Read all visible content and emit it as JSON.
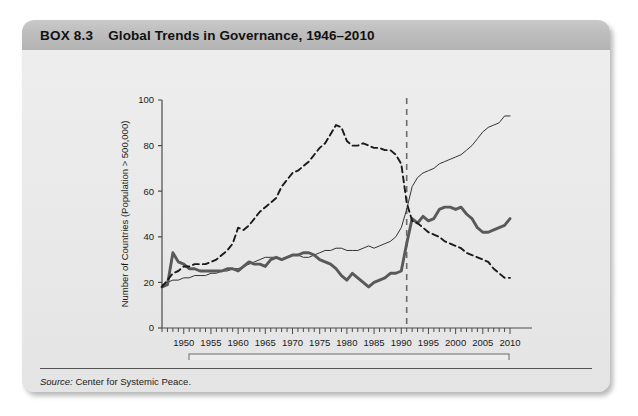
{
  "box": {
    "number": "BOX 8.3",
    "title": "Global Trends in Governance, 1946–2010"
  },
  "source": {
    "label": "Source:",
    "text": "Center for Systemic Peace."
  },
  "chart_data": {
    "type": "line",
    "title": "Global Trends in Governance, 1946–2010",
    "xlabel": "",
    "ylabel": "Number of Countries (Population > 500,000)",
    "xlim": [
      1946,
      2010
    ],
    "ylim": [
      0,
      100
    ],
    "ytick_labels": [
      "0",
      "20",
      "40",
      "60",
      "80",
      "100"
    ],
    "yticks": [
      0,
      20,
      40,
      60,
      80,
      100
    ],
    "xtick_labels": [
      "1950",
      "1955",
      "1960",
      "1965",
      "1970",
      "1975",
      "1980",
      "1985",
      "1990",
      "1995",
      "2000",
      "2005",
      "2010"
    ],
    "xticks": [
      1950,
      1955,
      1960,
      1965,
      1970,
      1975,
      1980,
      1985,
      1990,
      1995,
      2000,
      2005,
      2010
    ],
    "minor_tick_interval": 1,
    "grid": false,
    "legend_position": "bottom",
    "annotations": [
      {
        "type": "vline",
        "x": 1991,
        "style": "dashed",
        "color": "#6b6b6b"
      }
    ],
    "x": [
      1946,
      1947,
      1948,
      1949,
      1950,
      1951,
      1952,
      1953,
      1954,
      1955,
      1956,
      1957,
      1958,
      1959,
      1960,
      1961,
      1962,
      1963,
      1964,
      1965,
      1966,
      1967,
      1968,
      1969,
      1970,
      1971,
      1972,
      1973,
      1974,
      1975,
      1976,
      1977,
      1978,
      1979,
      1980,
      1981,
      1982,
      1983,
      1984,
      1985,
      1986,
      1987,
      1988,
      1989,
      1990,
      1991,
      1992,
      1993,
      1994,
      1995,
      1996,
      1997,
      1998,
      1999,
      2000,
      2001,
      2002,
      2003,
      2004,
      2005,
      2006,
      2007,
      2008,
      2009,
      2010
    ],
    "series": [
      {
        "name": "Democracies",
        "style": "thin-solid",
        "color": "#333333",
        "values": [
          19,
          20,
          21,
          21,
          22,
          22,
          23,
          23,
          23,
          24,
          24,
          25,
          25,
          26,
          26,
          27,
          28,
          29,
          30,
          31,
          31,
          31,
          30,
          31,
          32,
          32,
          31,
          31,
          32,
          33,
          34,
          34,
          35,
          35,
          34,
          34,
          34,
          35,
          36,
          35,
          36,
          37,
          38,
          40,
          44,
          52,
          62,
          66,
          68,
          69,
          70,
          72,
          73,
          74,
          75,
          76,
          78,
          80,
          83,
          86,
          88,
          89,
          90,
          93,
          93
        ]
      },
      {
        "name": "Anocracies",
        "style": "thick-solid",
        "color": "#595959",
        "values": [
          18,
          19,
          33,
          29,
          28,
          26,
          26,
          25,
          25,
          25,
          25,
          25,
          26,
          26,
          25,
          27,
          29,
          28,
          28,
          27,
          30,
          31,
          30,
          31,
          32,
          32,
          33,
          33,
          32,
          30,
          29,
          28,
          26,
          23,
          21,
          24,
          22,
          20,
          18,
          20,
          21,
          22,
          24,
          24,
          25,
          37,
          48,
          46,
          49,
          47,
          48,
          52,
          53,
          53,
          52,
          53,
          50,
          48,
          44,
          42,
          42,
          43,
          44,
          45,
          48
        ]
      },
      {
        "name": "Autocracies",
        "style": "dashed",
        "color": "#1a1a1a",
        "values": [
          18,
          21,
          24,
          25,
          27,
          27,
          28,
          28,
          28,
          29,
          30,
          32,
          34,
          37,
          44,
          43,
          45,
          48,
          51,
          53,
          55,
          57,
          62,
          65,
          68,
          69,
          71,
          73,
          76,
          79,
          81,
          85,
          89,
          88,
          82,
          80,
          80,
          81,
          80,
          79,
          79,
          78,
          78,
          76,
          72,
          55,
          47,
          46,
          44,
          42,
          41,
          40,
          38,
          37,
          36,
          35,
          33,
          32,
          31,
          30,
          29,
          26,
          24,
          22,
          22
        ]
      }
    ],
    "legend": [
      {
        "label": "Democracies",
        "style": "thin-solid"
      },
      {
        "label": "Anocracies",
        "style": "thick-solid"
      },
      {
        "label": "Autocracies",
        "style": "dashed"
      }
    ]
  }
}
